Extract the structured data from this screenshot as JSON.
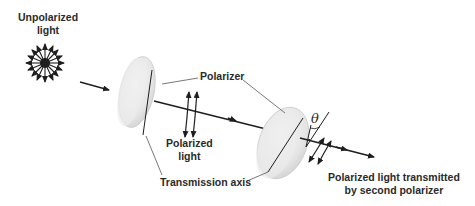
{
  "diagram": {
    "labels": {
      "unpolarized_line1": "Unpolarized",
      "unpolarized_line2": "light",
      "polarizer": "Polarizer",
      "polarized_line1": "Polarized",
      "polarized_line2": "light",
      "transmission_axis": "Transmission axis",
      "transmitted_line1": "Polarized light transmitted",
      "transmitted_line2": "by second polarizer",
      "angle_symbol": "θ"
    },
    "colors": {
      "line": "#1e1e1e",
      "text": "#2a2a2a",
      "lens_fill": "#e6e6e6",
      "lens_edge": "#c8c8c8"
    }
  }
}
